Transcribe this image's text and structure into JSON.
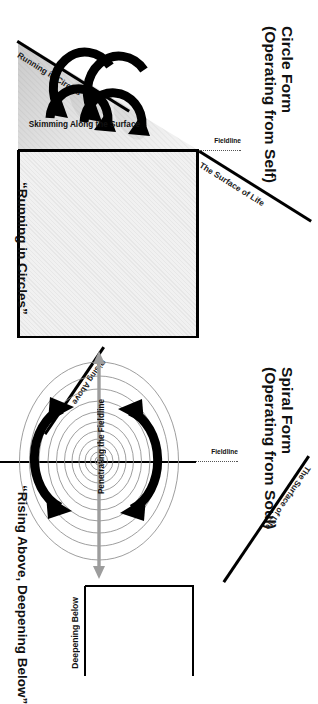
{
  "diagram": {
    "type": "conceptual-comparison",
    "orientation": "page rotated 90 degrees clockwise",
    "panels": [
      {
        "id": "circle-form",
        "title_line1": "Circle Form",
        "title_line2": "(Operating from Self)",
        "surface_label": "The Surface of Life",
        "fieldline_label": "Fieldline",
        "motion_label": "Skimming Along the Surface",
        "diagonal_label": "Running in Circles",
        "caption": "“Running in Circles”",
        "loops": 2,
        "below_region": "shaded-empty-box"
      },
      {
        "id": "spiral-form",
        "title_line1": "Spiral Form",
        "title_line2": "(Operating from Soul)",
        "surface_label": "The Surface of Life",
        "fieldline_label": "Fieldline",
        "motion_label": "Penetrating the Fieldline",
        "diagonal_label": "Rising Above",
        "below_axis_label": "Deepening Below",
        "caption": "“Rising Above, Deepening Below”",
        "spiral_turns": 11
      }
    ]
  },
  "colors": {
    "ink": "#111111",
    "line": "#000000",
    "spiral_stroke": "#8d8d8d",
    "grey_arrow": "#9d9d9d",
    "plane_light": "#f4f4f4",
    "plane_dark": "#d2d2d2",
    "box_fill": "#f1f1f1",
    "dotted": "#555555",
    "background": "#ffffff"
  }
}
